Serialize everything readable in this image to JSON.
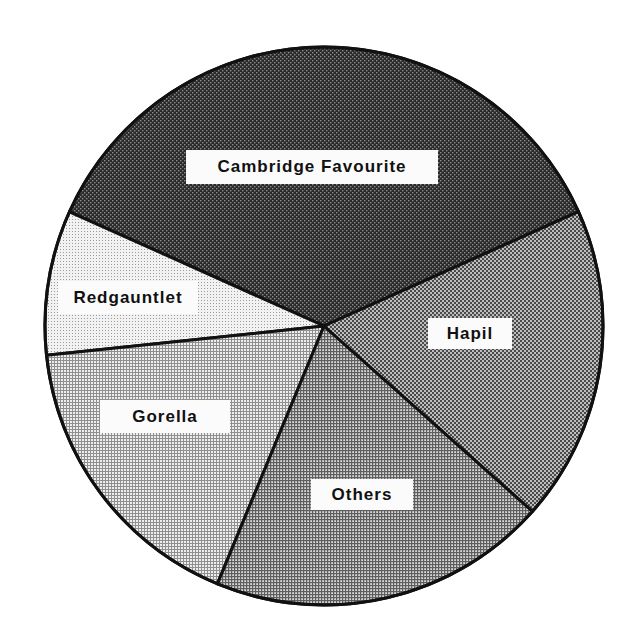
{
  "chart_data": {
    "type": "pie",
    "title": "",
    "start_angle_deg": 24.2,
    "direction": "counterclockwise",
    "slices": [
      {
        "label": "Cambridge Favourite",
        "value": 36.6,
        "fill": "#3a3a3a",
        "pattern": "dense-dark"
      },
      {
        "label": "Redgauntlet",
        "value": 8.4,
        "fill": "#e6e6e6",
        "pattern": "fine-light"
      },
      {
        "label": "Gorella",
        "value": 17.1,
        "fill": "#cfcfcf",
        "pattern": "grid-light"
      },
      {
        "label": "Others",
        "value": 19.7,
        "fill": "#a9a9a9",
        "pattern": "grid-medium"
      },
      {
        "label": "Hapil",
        "value": 18.3,
        "fill": "#8a8a8a",
        "pattern": "check-medium"
      }
    ],
    "units": "percent (estimated from slice angles)",
    "legend": "none (labels placed inside slices)"
  },
  "labels": {
    "cambridge": "Cambridge Favourite",
    "redgauntlet": "Redgauntlet",
    "gorella": "Gorella",
    "others": "Others",
    "hapil": "Hapil"
  },
  "colors": {
    "outline": "#111111",
    "label_background": "#fbfbfb",
    "label_text": "#111111"
  }
}
